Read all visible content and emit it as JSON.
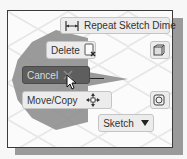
{
  "marking_menu": {
    "top": {
      "label": "Repeat Sketch Dime",
      "icon": "dimension-icon"
    },
    "upper_left": {
      "label": "Delete",
      "icon": "delete-icon"
    },
    "left": {
      "label": "Cancel",
      "icon": "close-icon",
      "state": "highlighted"
    },
    "lower_left": {
      "label": "Move/Copy",
      "icon": "move-icon"
    },
    "bottom": {
      "label": "Sketch",
      "icon": "caret-down-icon"
    },
    "upper_right": {
      "label": "",
      "icon": "box-icon"
    },
    "lower_right": {
      "label": "",
      "icon": "rotate-icon"
    }
  },
  "colors": {
    "highlight": "#5e5e5e",
    "wedge": "#8f8f8f",
    "button_bg": "#ececec",
    "frame_border": "#3a3a3a",
    "shadow": "#9a9a9a"
  }
}
